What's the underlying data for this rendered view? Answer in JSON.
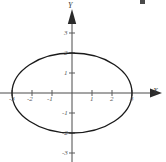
{
  "chart_data": {
    "type": "line",
    "title": "",
    "subtitle": "",
    "xlabel": "X",
    "ylabel": "Y",
    "grid": false,
    "legend": null,
    "xlim": [
      -3.6,
      4.0
    ],
    "ylim": [
      -3.4,
      3.4
    ],
    "x_ticks": [
      -3,
      -2,
      -1,
      1,
      2,
      3
    ],
    "y_ticks": [
      3,
      2,
      1,
      -1,
      -2,
      -3
    ],
    "x_tick_labels": [
      "-3",
      "-2",
      "-1",
      "1",
      "2",
      "3"
    ],
    "y_tick_labels": [
      "3",
      "2",
      "1",
      "-1",
      "-2",
      "-3"
    ],
    "annotations": [],
    "series": [
      {
        "name": "ellipse",
        "kind": "ellipse",
        "center": [
          0,
          0
        ],
        "semi_axis_x": 3,
        "semi_axis_y": 2,
        "equation": "x^2/9 + y^2/4 = 1",
        "x_intercepts": [
          -3,
          3
        ],
        "y_intercepts": [
          -2,
          2
        ],
        "stroke": "#1a1a1a",
        "stroke_width": 1.3,
        "fill": "none"
      }
    ]
  },
  "axes": {
    "x_label": "X",
    "y_label": "Y",
    "x_ticks": [
      {
        "value": -3,
        "label": "-3",
        "px": 12,
        "label_x": 9,
        "label_y": 96
      },
      {
        "value": -2,
        "label": "-2",
        "px": 32,
        "label_x": 27,
        "label_y": 96
      },
      {
        "value": -1,
        "label": "-1",
        "px": 52,
        "label_x": 47,
        "label_y": 96
      },
      {
        "value": 1,
        "label": "1",
        "px": 92,
        "label_x": 90,
        "label_y": 96
      },
      {
        "value": 2,
        "label": "2",
        "px": 112,
        "label_x": 110,
        "label_y": 96
      },
      {
        "value": 3,
        "label": "3",
        "px": 132,
        "label_x": 130,
        "label_y": 96
      }
    ],
    "y_ticks": [
      {
        "value": 3,
        "label": "3",
        "py": 33,
        "label_x": 64,
        "label_y": 30
      },
      {
        "value": 2,
        "label": "2",
        "py": 53,
        "label_x": 64,
        "label_y": 50
      },
      {
        "value": 1,
        "label": "1",
        "py": 73,
        "label_x": 64,
        "label_y": 70
      },
      {
        "value": -1,
        "label": "-1",
        "py": 113,
        "label_x": 62,
        "label_y": 110
      },
      {
        "value": -2,
        "label": "-2",
        "py": 133,
        "label_x": 62,
        "label_y": 130
      },
      {
        "value": -3,
        "label": "-3",
        "py": 153,
        "label_x": 62,
        "label_y": 150
      }
    ],
    "origin": {
      "x": 72,
      "y": 93
    },
    "unit_px": 20
  },
  "colors": {
    "background": "#ffffff",
    "curve": "#1a1a1a",
    "axis": "#4a4a4a",
    "tick_text": "#5a5a5a"
  }
}
